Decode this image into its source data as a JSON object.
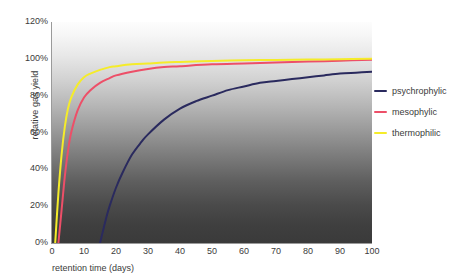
{
  "chart_data": {
    "type": "line",
    "title": "",
    "xlabel": "retention time (days)",
    "ylabel": "relative gas yield",
    "xlim": [
      0,
      100
    ],
    "ylim": [
      0,
      120
    ],
    "grid": false,
    "legend_position": "right",
    "x_ticks": [
      "0",
      "10",
      "20",
      "30",
      "40",
      "50",
      "60",
      "70",
      "80",
      "90",
      "100"
    ],
    "x_tick_values": [
      0,
      10,
      20,
      30,
      40,
      50,
      60,
      70,
      80,
      90,
      100
    ],
    "y_ticks": [
      "0%",
      "20%",
      "40%",
      "60%",
      "80%",
      "100%",
      "120%"
    ],
    "y_tick_values": [
      0,
      20,
      40,
      60,
      80,
      100,
      120
    ],
    "background": "vertical gradient white to dark gray",
    "series": [
      {
        "name": "psychrophylic",
        "color": "#2a2a5e",
        "x": [
          15,
          16,
          17,
          18,
          20,
          22,
          25,
          28,
          30,
          35,
          40,
          45,
          50,
          55,
          60,
          65,
          70,
          75,
          80,
          85,
          90,
          95,
          100
        ],
        "values": [
          0,
          7,
          14,
          20,
          30,
          38,
          48,
          55,
          59,
          67,
          73,
          77,
          80,
          83,
          85,
          87,
          88,
          89,
          90,
          91,
          92,
          92.5,
          93
        ]
      },
      {
        "name": "mesophylic",
        "color": "#ed4f68",
        "x": [
          2,
          3,
          4,
          5,
          6,
          8,
          10,
          12,
          15,
          18,
          20,
          25,
          30,
          35,
          40,
          50,
          60,
          70,
          80,
          90,
          100
        ],
        "values": [
          0,
          18,
          36,
          50,
          60,
          72,
          79,
          83,
          87,
          89.5,
          91,
          93,
          94.5,
          95.5,
          96,
          97,
          97.5,
          98,
          98.5,
          99,
          99.5
        ]
      },
      {
        "name": "thermophilic",
        "color": "#f5ec2a",
        "x": [
          1,
          2,
          3,
          4,
          5,
          6,
          8,
          10,
          12,
          15,
          18,
          20,
          25,
          30,
          35,
          40,
          50,
          60,
          70,
          80,
          90,
          100
        ],
        "values": [
          0,
          27,
          48,
          63,
          73,
          79,
          86,
          90,
          92,
          94,
          95.5,
          96,
          97,
          97.5,
          98,
          98.3,
          98.8,
          99.2,
          99.4,
          99.6,
          99.8,
          100
        ]
      }
    ]
  }
}
